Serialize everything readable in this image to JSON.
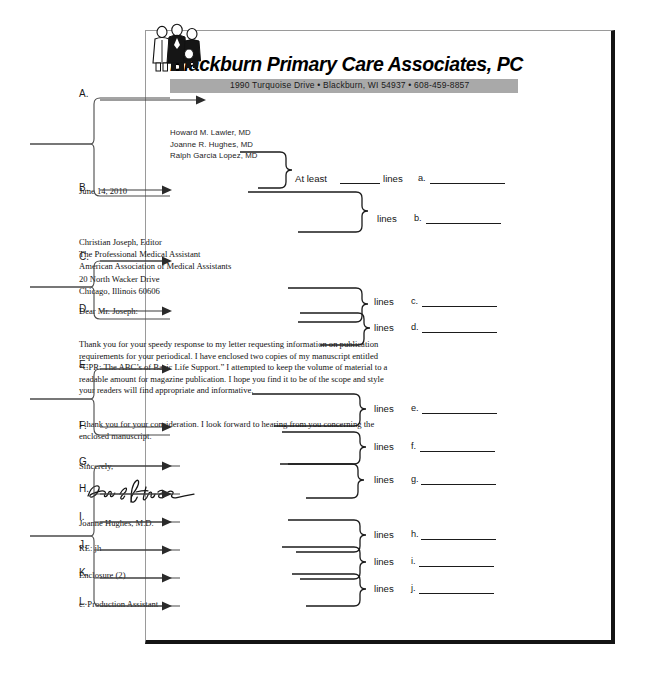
{
  "document": {
    "kind": "business-letter-parts-worksheet"
  },
  "letterhead": {
    "company_name": "Blackburn Primary Care Associates, PC",
    "address_bar": "1990 Turquoise Drive  •  Blackburn, WI 54937  •  608-459-8857",
    "logo_icon": "people-clipart-icon",
    "doctors": [
      "Howard M. Lawler, MD",
      "Joanne R. Hughes, MD",
      "Ralph Garcia Lopez, MD"
    ]
  },
  "letter": {
    "date": "June 14, 2010",
    "inside_address": [
      "Christian Joseph, Editor",
      "The Professional Medical Assistant",
      "American Association of Medical Assistants",
      "20 North Wacker Drive",
      "Chicago, Illinois 60606"
    ],
    "salutation": "Dear Mr. Joseph:",
    "body_paragraph_1": "Thank you for your speedy response to my letter requesting information on publication requirements for your periodical.  I have enclosed two copies of my manuscript entitled “CPR: The ABC’s of Basic Life Support.”  I attempted to keep the volume of material to a readable amount for magazine publication.  I hope you find it to be of the scope and style your readers will find appropriate and informative.",
    "body_paragraph_2": "I thank you for your consideration.  I look forward to hearing from you concerning the enclosed manuscript.",
    "complimentary_close": "Sincerely,",
    "signature_name": "Joanne Hughes",
    "signer_typed_name": "Joanne Hughes, M.D.",
    "reference_initials": "RE: jh",
    "enclosure_notation": "Enclosure (2)",
    "copy_notation": "c: Production Assistant"
  },
  "spacing_questions": {
    "at_least_label": "At least",
    "lines_label": "lines",
    "items": [
      {
        "letter": "a."
      },
      {
        "letter": "b."
      },
      {
        "letter": "c."
      },
      {
        "letter": "d."
      },
      {
        "letter": "e."
      },
      {
        "letter": "f."
      },
      {
        "letter": "g."
      },
      {
        "letter": "h."
      },
      {
        "letter": "i."
      },
      {
        "letter": "j."
      }
    ]
  },
  "part_labels": [
    {
      "letter": "A."
    },
    {
      "letter": "B."
    },
    {
      "letter": "C."
    },
    {
      "letter": "D."
    },
    {
      "letter": "E."
    },
    {
      "letter": "F."
    },
    {
      "letter": "G."
    },
    {
      "letter": "H."
    },
    {
      "letter": "I."
    },
    {
      "letter": "J."
    },
    {
      "letter": "K."
    },
    {
      "letter": "L."
    }
  ]
}
